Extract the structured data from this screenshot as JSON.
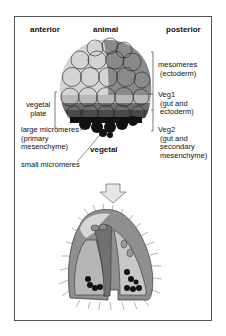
{
  "figure": {
    "axis_labels": {
      "top_left": "anterior",
      "top_center": "animal",
      "top_right": "posterior",
      "bottom_center": "vegetal"
    },
    "right_labels": {
      "mesomeres": "mesomeres\n (ectoderm)",
      "veg1": "Veg1\n (gut and\n ectoderm)",
      "veg2": "Veg2\n (gut and\n secondary\n mesenchyme)"
    },
    "left_labels": {
      "vegetal_plate": " vegetal\n   plate",
      "large_micromeres": "large micromeres\n(primary\nmesenchyme)",
      "small_micromeres": "small micromeres"
    },
    "colors": {
      "mesomere_light": "#d4d4d4",
      "mesomere_dark": "#8a8a8a",
      "veg1_light": "#b8b8b8",
      "veg1_band": "#6e6e6e",
      "veg2": "#4a4a4a",
      "micromeres": "#111111",
      "arrow_fill": "#e6e6e6",
      "frame": "#555555"
    }
  }
}
